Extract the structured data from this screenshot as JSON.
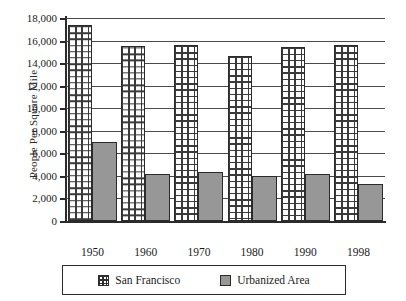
{
  "chart_data": {
    "type": "bar",
    "title": "",
    "xlabel": "",
    "ylabel": "People Per Square Mile",
    "categories": [
      "1950",
      "1960",
      "1970",
      "1980",
      "1990",
      "1998"
    ],
    "series": [
      {
        "name": "San Francisco",
        "values": [
          17400,
          15550,
          15600,
          14600,
          15400,
          15600
        ]
      },
      {
        "name": "Urbanized Area",
        "values": [
          7000,
          4150,
          4350,
          3950,
          4150,
          3300
        ]
      }
    ],
    "ylim": [
      0,
      18000
    ],
    "yticks": [
      "0",
      "2,000",
      "4,000",
      "6,000",
      "8,000",
      "10,000",
      "12,000",
      "14,000",
      "16,000",
      "18,000"
    ],
    "ytick_values": [
      0,
      2000,
      4000,
      6000,
      8000,
      10000,
      12000,
      14000,
      16000,
      18000
    ],
    "grid": true,
    "legend_position": "bottom",
    "colors": {
      "san_francisco": "#ffffff",
      "san_francisco_pattern": "#3a3a3a",
      "urbanized_area": "#979797",
      "axis": "#2b2b2b",
      "gridline": "#4a4a4a",
      "background": "#ffffff"
    }
  },
  "legend": {
    "items": [
      {
        "label": "San Francisco",
        "swatch": "grid-pattern-swatch"
      },
      {
        "label": "Urbanized Area",
        "swatch": "gray-solid-swatch"
      }
    ]
  }
}
